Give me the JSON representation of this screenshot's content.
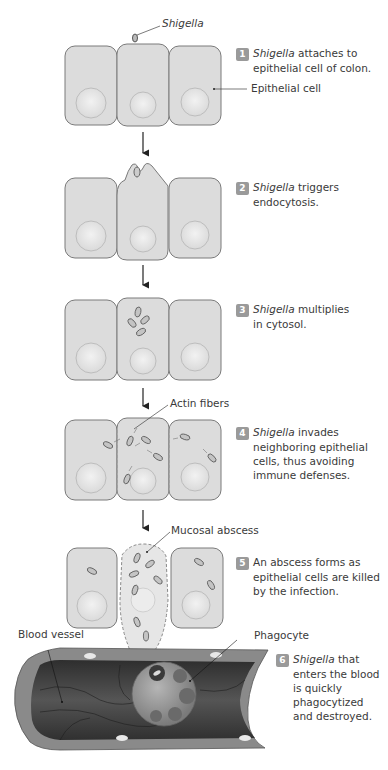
{
  "figure": {
    "colors": {
      "cell_fill": "#dcdcdc",
      "cell_stroke": "#7a7a7a",
      "nucleus_fill": "#e6e6e6",
      "badge": "#9a9a9a",
      "text": "#3a3a3a",
      "vessel_dark": "#3d3d3d",
      "vessel_wall": "#8a8a8a",
      "phagocyte": "#8c8c8c"
    }
  },
  "callouts": {
    "shigella": "Shigella",
    "epithelial_cell": "Epithelial cell",
    "actin_fibers": "Actin fibers",
    "mucosal_abscess": "Mucosal abscess",
    "blood_vessel": "Blood vessel",
    "phagocyte": "Phagocyte"
  },
  "steps": [
    {
      "number": "1",
      "italic": "Shigella",
      "line1": " attaches to",
      "rest": [
        "epithelial cell of colon."
      ]
    },
    {
      "number": "2",
      "italic": "Shigella",
      "line1": " triggers",
      "rest": [
        "endocytosis."
      ]
    },
    {
      "number": "3",
      "italic": "Shigella",
      "line1": " multiplies",
      "rest": [
        "in cytosol."
      ]
    },
    {
      "number": "4",
      "italic": "Shigella",
      "line1": " invades",
      "rest": [
        "neighboring epithelial",
        "cells, thus avoiding",
        "immune defenses."
      ]
    },
    {
      "number": "5",
      "italic": "",
      "line1": "An abscess forms as",
      "rest": [
        "epithelial cells are killed",
        "by the infection."
      ]
    },
    {
      "number": "6",
      "italic": "Shigella",
      "line1": " that",
      "rest": [
        "enters the blood",
        "is quickly",
        "phagocytized",
        "and destroyed."
      ]
    }
  ]
}
